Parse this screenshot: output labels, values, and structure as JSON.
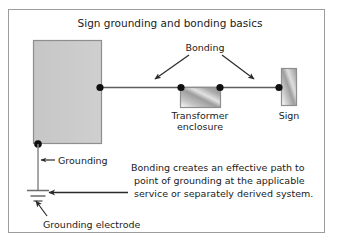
{
  "figure": {
    "title": "Sign grounding and bonding basics",
    "frame_border_color": "#9c9c9c",
    "background_color": "#ffffff",
    "width": 341,
    "height": 249
  },
  "labels": {
    "bonding": "Bonding",
    "transformer_line1": "Transformer",
    "transformer_line2": "enclosure",
    "sign": "Sign",
    "grounding": "Grounding",
    "grounding_electrode": "Grounding electrode"
  },
  "note": {
    "line1": "Bonding creates an effective path to",
    "line2": "point of grounding at the applicable",
    "line3": "service or separately derived system."
  },
  "colors": {
    "enclosure_fill": "#b9b9b9",
    "building_fill": "#c9c9c9",
    "sign_fill": "#bdbdbd",
    "conductor": "#5e5e5e",
    "node": "#101010",
    "text": "#1b1b1b"
  }
}
